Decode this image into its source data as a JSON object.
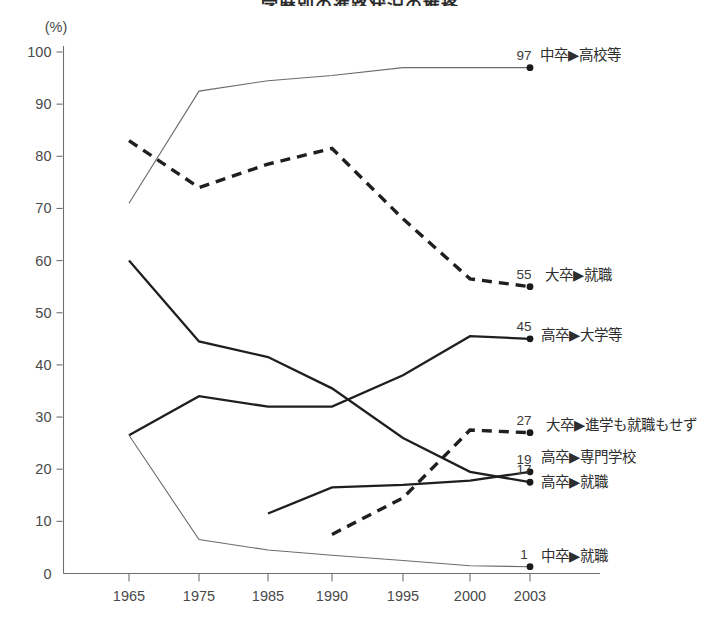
{
  "title": "学歴別の進路状況の推移",
  "chart_data": {
    "type": "line",
    "title": "学歴別の進路状況の推移",
    "xlabel": "",
    "ylabel": "(%)",
    "unit": "(%)",
    "grid": false,
    "legend_position": "right-inline",
    "x": [
      1965,
      1975,
      1985,
      1990,
      1995,
      2000,
      2003
    ],
    "xtick_labels": [
      "1965",
      "1975",
      "1985",
      "1990",
      "1995",
      "2000",
      "2003"
    ],
    "ytick_labels": [
      "100",
      "90",
      "80",
      "70",
      "60",
      "50",
      "40",
      "30",
      "20",
      "10",
      "0"
    ],
    "ylim": [
      0,
      100
    ],
    "ytick_step": 10,
    "series": [
      {
        "name": "中卒▶高校等",
        "style": "thin-solid",
        "end_value": "97",
        "x": [
          1965,
          1975,
          1985,
          1990,
          1995,
          2000,
          2003
        ],
        "values": [
          71,
          92.5,
          94.5,
          95.5,
          97,
          97,
          97
        ]
      },
      {
        "name": "大卒▶就職",
        "style": "dashed",
        "end_value": "55",
        "x": [
          1965,
          1975,
          1985,
          1990,
          1995,
          2000,
          2003
        ],
        "values": [
          83,
          74,
          78.5,
          81.5,
          68,
          56.5,
          55
        ]
      },
      {
        "name": "高卒▶大学等",
        "style": "solid",
        "end_value": "45",
        "x": [
          1965,
          1975,
          1985,
          1990,
          1995,
          2000,
          2003
        ],
        "values": [
          26.5,
          34,
          32,
          32,
          38,
          45.5,
          45
        ]
      },
      {
        "name": "大卒▶進学も就職もせず",
        "style": "dashed",
        "end_value": "27",
        "x": [
          1990,
          1995,
          2000,
          2003
        ],
        "values": [
          7.5,
          14.5,
          27.5,
          27
        ]
      },
      {
        "name": "高卒▶専門学校",
        "style": "solid",
        "end_value": "19",
        "x": [
          1985,
          1990,
          1995,
          2000,
          2003
        ],
        "values": [
          11.5,
          16.5,
          17,
          17.8,
          19.5
        ]
      },
      {
        "name": "高卒▶就職",
        "style": "solid",
        "end_value": "17",
        "x": [
          1965,
          1975,
          1985,
          1990,
          1995,
          2000,
          2003
        ],
        "values": [
          60,
          44.5,
          41.5,
          35.5,
          26,
          19.5,
          17.5
        ]
      },
      {
        "name": "中卒▶就職",
        "style": "thin-solid",
        "end_value": "1",
        "x": [
          1965,
          1975,
          1985,
          1990,
          1995,
          2000,
          2003
        ],
        "values": [
          26.5,
          6.5,
          4.5,
          3.5,
          2.5,
          1.5,
          1.3
        ]
      }
    ]
  },
  "labels": {
    "s0": "中卒▶高校等",
    "s1": "大卒▶就職",
    "s2": "高卒▶大学等",
    "s3": "大卒▶進学も就職もせず",
    "s4": "高卒▶専門学校",
    "s5": "高卒▶就職",
    "s6": "中卒▶就職"
  },
  "endvals": {
    "s0": "97",
    "s1": "55",
    "s2": "45",
    "s3": "27",
    "s4": "19",
    "s5": "17",
    "s6": "1"
  },
  "yticks": [
    "100",
    "90",
    "80",
    "70",
    "60",
    "50",
    "40",
    "30",
    "20",
    "10",
    "0"
  ],
  "xticks": [
    "1965",
    "1975",
    "1985",
    "1990",
    "1995",
    "2000",
    "2003"
  ]
}
